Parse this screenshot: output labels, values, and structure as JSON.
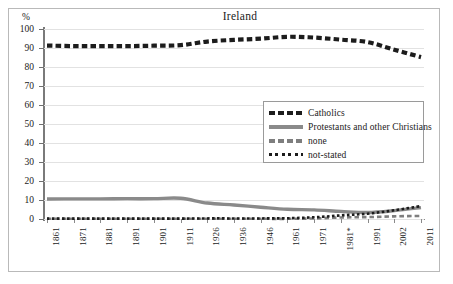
{
  "figure": {
    "title": "Ireland",
    "y_unit_label": "%"
  },
  "chart_data": {
    "type": "line",
    "title": "Ireland",
    "xlabel": "",
    "ylabel": "%",
    "ylim": [
      0,
      100
    ],
    "yticks": [
      0,
      10,
      20,
      30,
      40,
      50,
      60,
      70,
      80,
      90,
      100
    ],
    "grid": true,
    "legend_position": "center-right",
    "categories": [
      "1861",
      "1871",
      "1881",
      "1891",
      "1901",
      "1911",
      "1926",
      "1936",
      "1946",
      "1961",
      "1971",
      "1981*",
      "1991",
      "2002",
      "2011"
    ],
    "series": [
      {
        "name": "Catholics",
        "style": "thick-dashed",
        "color": "#1c1c1c",
        "values": [
          91.3,
          91.0,
          91.0,
          91.0,
          91.2,
          91.5,
          93.4,
          94.3,
          94.9,
          95.9,
          95.5,
          94.4,
          93.1,
          89.1,
          85.2
        ]
      },
      {
        "name": "Protestants and other Christians",
        "style": "solid",
        "color": "#8a8a8a",
        "values": [
          10.5,
          10.6,
          10.6,
          10.7,
          10.7,
          10.9,
          8.4,
          7.4,
          6.2,
          5.1,
          4.8,
          4.0,
          3.4,
          4.4,
          6.0
        ]
      },
      {
        "name": "none",
        "style": "thin-dashed",
        "color": "#7e7e7e",
        "values": [
          0.1,
          0.1,
          0.1,
          0.1,
          0.1,
          0.1,
          0.1,
          0.1,
          0.1,
          0.1,
          0.3,
          0.8,
          1.0,
          1.4,
          1.6
        ]
      },
      {
        "name": "not-stated",
        "style": "dotted",
        "color": "#1c1c1c",
        "values": [
          0.2,
          0.2,
          0.2,
          0.2,
          0.2,
          0.2,
          0.3,
          0.3,
          0.3,
          0.4,
          0.9,
          1.9,
          2.8,
          4.6,
          6.8
        ]
      }
    ]
  },
  "y_axis": {
    "ticks": [
      "100",
      "90",
      "80",
      "70",
      "60",
      "50",
      "40",
      "30",
      "20",
      "10",
      "0"
    ]
  },
  "x_axis": {
    "ticks": [
      "1861",
      "1871",
      "1881",
      "1891",
      "1901",
      "1911",
      "1926",
      "1936",
      "1946",
      "1961",
      "1971",
      "1981*",
      "1991",
      "2002",
      "2011"
    ]
  },
  "legend": {
    "items": [
      {
        "label": "Catholics",
        "swatch": "thick-dashed-swatch"
      },
      {
        "label": "Protestants and other Christians",
        "swatch": "solid-swatch"
      },
      {
        "label": "none",
        "swatch": "thin-dashed-swatch"
      },
      {
        "label": "not-stated",
        "swatch": "dotted-swatch"
      }
    ]
  },
  "colors": {
    "catholics": "#1c1c1c",
    "protestants": "#8a8a8a",
    "none": "#7e7e7e",
    "not_stated": "#1c1c1c",
    "grid": "#e2e2e2",
    "axis": "#7a7a7a",
    "border": "#b9b9b9"
  }
}
